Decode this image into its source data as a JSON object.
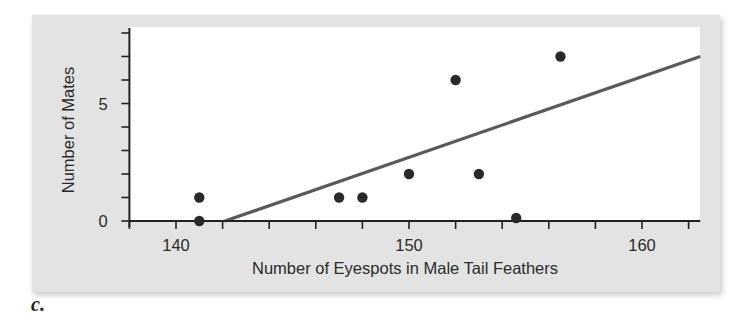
{
  "caption": "c.",
  "chart_data": {
    "type": "scatter",
    "title": "",
    "xlabel": "Number of Eyespots in Male Tail Feathers",
    "ylabel": "Number of Mates",
    "xlim": [
      138,
      162.5
    ],
    "ylim": [
      0,
      8
    ],
    "x_tick_labels": [
      "140",
      "150",
      "160"
    ],
    "x_tick_label_values": [
      140,
      150,
      160
    ],
    "x_minor_tick_step": 2,
    "y_tick_labels": [
      "0",
      "5"
    ],
    "y_tick_label_values": [
      0,
      5
    ],
    "y_minor_tick_step": 1,
    "grid": false,
    "legend": null,
    "series": [
      {
        "name": "observations",
        "points": [
          {
            "x": 141,
            "y": 1
          },
          {
            "x": 141,
            "y": 0
          },
          {
            "x": 147,
            "y": 1
          },
          {
            "x": 148,
            "y": 1
          },
          {
            "x": 150,
            "y": 2
          },
          {
            "x": 152,
            "y": 6
          },
          {
            "x": 153,
            "y": 2
          },
          {
            "x": 154.6,
            "y": 0
          },
          {
            "x": 156.5,
            "y": 7
          }
        ]
      }
    ],
    "trendline": {
      "name": "regression line",
      "start": {
        "x": 142.1,
        "y": 0
      },
      "end": {
        "x": 162.5,
        "y": 7
      }
    },
    "colors": {
      "panel_bg": "#e3e3e3",
      "plot_bg": "#ffffff",
      "points": "#2a2a2a",
      "trendline": "#5a5a5a",
      "axis": "#222222"
    }
  }
}
